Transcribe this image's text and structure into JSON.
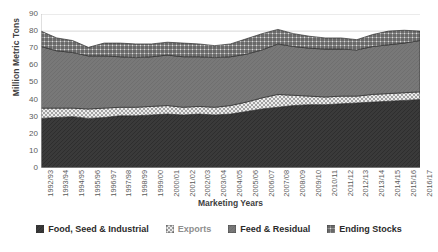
{
  "chart_data": {
    "type": "area",
    "stacked": true,
    "title": "",
    "xlabel": "Marketing Years",
    "ylabel": "Million Metric Tons",
    "ylim": [
      0,
      90
    ],
    "yticks": [
      0,
      10,
      20,
      30,
      40,
      50,
      60,
      70,
      80,
      90
    ],
    "grid": true,
    "legend_position": "bottom",
    "categories": [
      "1992/93",
      "1993/94",
      "1994/95",
      "1995/96",
      "1996/97",
      "1997/98",
      "1998/99",
      "1999/00",
      "2000/01",
      "2001/02",
      "2002/03",
      "2003/04",
      "2004/05",
      "2005/06",
      "2006/07",
      "2007/08",
      "2008/09",
      "2009/10",
      "2010/11",
      "2011/12",
      "2012/13",
      "2013/14",
      "2014/15",
      "2015/16",
      "2016/17"
    ],
    "series": [
      {
        "name": "Food, Seed & Industrial",
        "pattern": "dark-solid",
        "color": "#3a3a3a",
        "values": [
          29.0,
          29.5,
          30.0,
          29.0,
          29.5,
          30.5,
          30.5,
          31.0,
          31.5,
          31.0,
          31.5,
          31.0,
          31.5,
          33.0,
          34.5,
          35.5,
          36.5,
          37.0,
          37.0,
          37.5,
          38.0,
          38.5,
          39.0,
          39.5,
          40.0
        ]
      },
      {
        "name": "Exports",
        "pattern": "light-checker",
        "color": "#e2e2e2",
        "values": [
          6.0,
          5.5,
          5.0,
          5.5,
          5.5,
          5.0,
          5.0,
          5.0,
          5.0,
          4.5,
          4.5,
          4.5,
          5.0,
          5.5,
          6.5,
          7.5,
          6.0,
          5.0,
          4.5,
          4.5,
          4.0,
          4.5,
          4.5,
          4.5,
          4.5
        ]
      },
      {
        "name": "Feed & Residual",
        "pattern": "mid-gray",
        "color": "#777777",
        "values": [
          36.0,
          33.5,
          32.5,
          31.0,
          30.5,
          29.5,
          29.0,
          29.0,
          29.5,
          29.5,
          29.0,
          29.0,
          28.5,
          28.0,
          28.0,
          29.5,
          28.5,
          28.0,
          28.0,
          27.5,
          27.0,
          28.0,
          28.5,
          29.0,
          30.0
        ]
      },
      {
        "name": "Ending Stocks",
        "pattern": "dark-checker",
        "color": "#cfcfcf",
        "values": [
          9.0,
          7.5,
          7.0,
          5.0,
          7.5,
          8.0,
          8.0,
          7.5,
          7.5,
          8.0,
          7.5,
          7.0,
          7.5,
          9.0,
          9.5,
          8.5,
          7.5,
          7.0,
          6.5,
          6.5,
          6.0,
          7.0,
          8.0,
          7.5,
          5.5
        ]
      }
    ]
  },
  "legend": {
    "items": [
      {
        "label": "Food, Seed & Industrial",
        "swatch": "dark-solid"
      },
      {
        "label": "Exports",
        "swatch": "light-checker"
      },
      {
        "label": "Feed & Residual",
        "swatch": "mid-gray"
      },
      {
        "label": "Ending Stocks",
        "swatch": "dark-checker"
      }
    ]
  }
}
